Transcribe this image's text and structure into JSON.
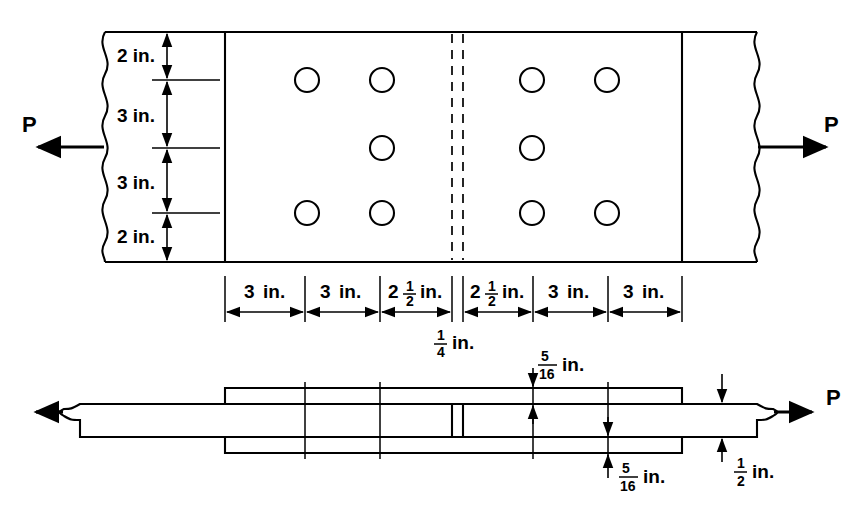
{
  "figure": {
    "line_color": "#000000",
    "background_color": "#ffffff"
  },
  "load_labels": {
    "left": "P",
    "right": "P",
    "side_right": "P"
  },
  "plan_view": {
    "name": "plan-view",
    "vertical_dimensions": [
      {
        "id": "edge-top",
        "value": "2 in.",
        "whole": "2",
        "unit": "in."
      },
      {
        "id": "gage-upper",
        "value": "3 in.",
        "whole": "3",
        "unit": "in."
      },
      {
        "id": "gage-lower",
        "value": "3 in.",
        "whole": "3",
        "unit": "in."
      },
      {
        "id": "edge-bottom",
        "value": "2 in.",
        "whole": "2",
        "unit": "in."
      }
    ],
    "horizontal_dimensions": [
      {
        "id": "pitch-1",
        "whole": "3",
        "num": "",
        "den": "",
        "unit": "in."
      },
      {
        "id": "pitch-2",
        "whole": "3",
        "num": "",
        "den": "",
        "unit": "in."
      },
      {
        "id": "pitch-3",
        "whole": "2",
        "num": "1",
        "den": "2",
        "unit": "in."
      },
      {
        "id": "pitch-4",
        "whole": "2",
        "num": "1",
        "den": "2",
        "unit": "in."
      },
      {
        "id": "pitch-5",
        "whole": "3",
        "num": "",
        "den": "",
        "unit": "in."
      },
      {
        "id": "pitch-6",
        "whole": "3",
        "num": "",
        "den": "",
        "unit": "in."
      }
    ],
    "gap_dimension": {
      "id": "joint-gap",
      "whole": "",
      "num": "1",
      "den": "4",
      "unit": "in."
    },
    "hole_rows": 3,
    "holes_per_side": 5,
    "hole_columns_left": [
      307,
      382
    ],
    "hole_columns_right": [
      532,
      607
    ],
    "hole_rows_y": [
      80,
      148,
      213
    ],
    "hole_radius": 12
  },
  "elevation_view": {
    "name": "elevation-view",
    "thickness_dimensions": [
      {
        "id": "top-cover-plate",
        "whole": "",
        "num": "5",
        "den": "16",
        "unit": "in."
      },
      {
        "id": "bottom-cover-plate",
        "whole": "",
        "num": "5",
        "den": "16",
        "unit": "in."
      },
      {
        "id": "main-plate",
        "whole": "",
        "num": "1",
        "den": "2",
        "unit": "in."
      }
    ]
  }
}
